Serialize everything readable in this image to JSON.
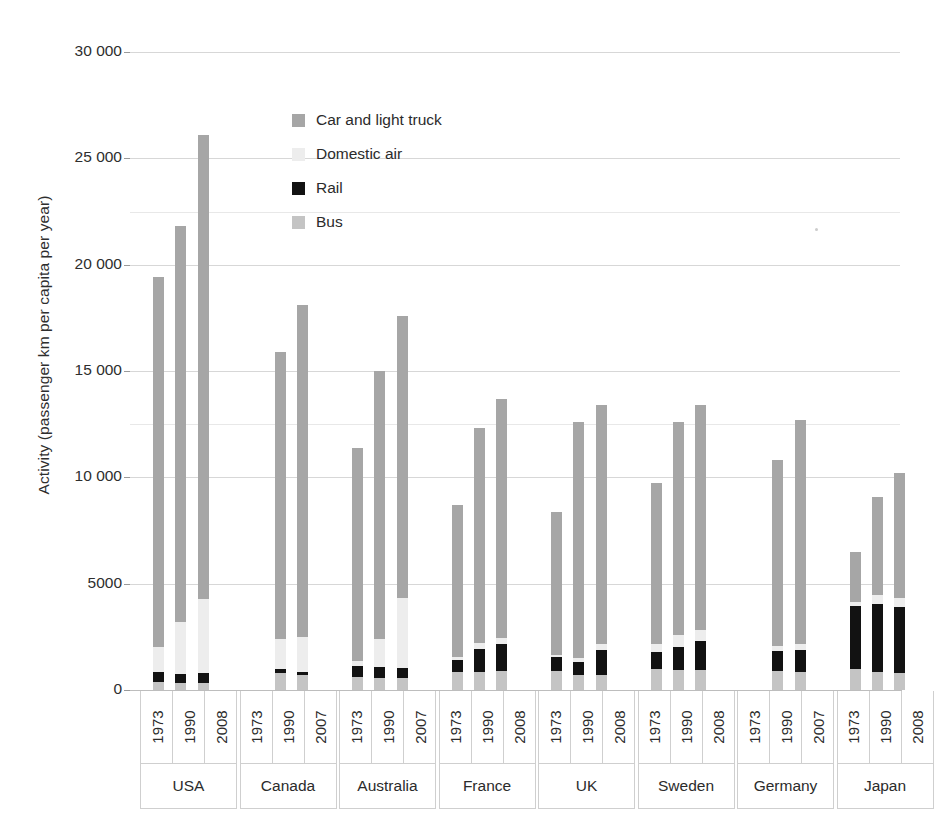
{
  "chart_data": {
    "type": "bar",
    "subtype": "stacked-bar-grouped",
    "title": "",
    "xlabel": "",
    "ylabel": "Activity (passenger km per capita per year)",
    "ylim": [
      0,
      30000
    ],
    "ytick_labels": [
      "30 000",
      "25 000",
      "20 000",
      "15 000",
      "10 000",
      "5000",
      "0"
    ],
    "ytick_values": [
      30000,
      25000,
      20000,
      15000,
      10000,
      5000,
      0
    ],
    "grid": true,
    "grid_axis": "y",
    "legend_position": "inside-upper-left",
    "legend": [
      "Car and light truck",
      "Domestic air",
      "Rail",
      "Bus"
    ],
    "series": [
      {
        "name": "Bus",
        "color": "#c4c4c4"
      },
      {
        "name": "Rail",
        "color": "#121212"
      },
      {
        "name": "Domestic air",
        "color": "#ededed"
      },
      {
        "name": "Car and light truck",
        "color": "#a6a6a6"
      }
    ],
    "groups": [
      {
        "country": "USA",
        "bars": [
          {
            "year": "1973",
            "total": 19400,
            "bus": 400,
            "rail": 450,
            "air": 1150,
            "car": 17400
          },
          {
            "year": "1990",
            "total": 21800,
            "bus": 350,
            "rail": 400,
            "air": 2450,
            "car": 18600
          },
          {
            "year": "2008",
            "total": 26100,
            "bus": 350,
            "rail": 450,
            "air": 3500,
            "car": 21800
          }
        ]
      },
      {
        "country": "Canada",
        "bars": [
          {
            "year": "1973",
            "total": 0,
            "bus": 0,
            "rail": 0,
            "air": 0,
            "car": 0
          },
          {
            "year": "1990",
            "total": 15900,
            "bus": 800,
            "rail": 200,
            "air": 1400,
            "car": 13500
          },
          {
            "year": "2007",
            "total": 18100,
            "bus": 700,
            "rail": 150,
            "air": 1650,
            "car": 15600
          }
        ]
      },
      {
        "country": "Australia",
        "bars": [
          {
            "year": "1973",
            "total": 11400,
            "bus": 600,
            "rail": 550,
            "air": 200,
            "car": 10050
          },
          {
            "year": "1990",
            "total": 15000,
            "bus": 550,
            "rail": 550,
            "air": 1300,
            "car": 12600
          },
          {
            "year": "2007",
            "total": 17600,
            "bus": 550,
            "rail": 500,
            "air": 3300,
            "car": 13250
          }
        ]
      },
      {
        "country": "France",
        "bars": [
          {
            "year": "1973",
            "total": 8700,
            "bus": 850,
            "rail": 550,
            "air": 150,
            "car": 7150
          },
          {
            "year": "1990",
            "total": 12300,
            "bus": 850,
            "rail": 1100,
            "air": 250,
            "car": 10100
          },
          {
            "year": "2008",
            "total": 13700,
            "bus": 900,
            "rail": 1250,
            "air": 300,
            "car": 11250
          }
        ]
      },
      {
        "country": "UK",
        "bars": [
          {
            "year": "1973",
            "total": 8350,
            "bus": 900,
            "rail": 650,
            "air": 100,
            "car": 6700
          },
          {
            "year": "1990",
            "total": 12600,
            "bus": 700,
            "rail": 600,
            "air": 200,
            "car": 11100
          },
          {
            "year": "2008",
            "total": 13400,
            "bus": 700,
            "rail": 1200,
            "air": 250,
            "car": 11250
          }
        ]
      },
      {
        "country": "Sweden",
        "bars": [
          {
            "year": "1973",
            "total": 9750,
            "bus": 1000,
            "rail": 800,
            "air": 350,
            "car": 7600
          },
          {
            "year": "1990",
            "total": 12600,
            "bus": 950,
            "rail": 1050,
            "air": 600,
            "car": 10000
          },
          {
            "year": "2008",
            "total": 13400,
            "bus": 950,
            "rail": 1350,
            "air": 500,
            "car": 10600
          }
        ]
      },
      {
        "country": "Germany",
        "bars": [
          {
            "year": "1973",
            "total": 0,
            "bus": 0,
            "rail": 0,
            "air": 0,
            "car": 0
          },
          {
            "year": "1990",
            "total": 10800,
            "bus": 900,
            "rail": 950,
            "air": 200,
            "car": 8750
          },
          {
            "year": "2007",
            "total": 12700,
            "bus": 850,
            "rail": 1050,
            "air": 250,
            "car": 10550
          }
        ]
      },
      {
        "country": "Japan",
        "bars": [
          {
            "year": "1973",
            "total": 6500,
            "bus": 1000,
            "rail": 2950,
            "air": 200,
            "car": 2350
          },
          {
            "year": "1990",
            "total": 9100,
            "bus": 850,
            "rail": 3200,
            "air": 400,
            "car": 4650
          },
          {
            "year": "2008",
            "total": 10200,
            "bus": 800,
            "rail": 3100,
            "air": 450,
            "car": 5850
          }
        ]
      }
    ]
  }
}
